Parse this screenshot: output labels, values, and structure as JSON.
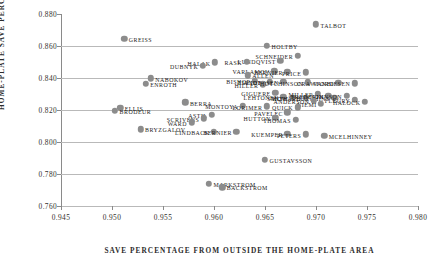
{
  "chart_data": {
    "type": "scatter",
    "title": "",
    "xlabel": "SAVE PERCENTAGE FROM OUTSIDE THE HOME-PLATE AREA",
    "ylabel": "HOME-PLATE SAVE PERCENTAGE",
    "xlim": [
      0.945,
      0.98
    ],
    "ylim": [
      0.76,
      0.88
    ],
    "xticks": [
      "0.945",
      "0.950",
      "0.955",
      "0.960",
      "0.965",
      "0.970",
      "0.975",
      "0.980"
    ],
    "yticks": [
      "0.880",
      "0.860",
      "0.840",
      "0.820",
      "0.800",
      "0.780",
      "0.760"
    ],
    "grid": "horizontal",
    "legend": "none",
    "marker_color": "#8c8c8c",
    "points": [
      {
        "label": "GREISS",
        "x": 0.9512,
        "y": 0.8645,
        "side": "right"
      },
      {
        "label": "HOLTBY",
        "x": 0.9652,
        "y": 0.86,
        "side": "right"
      },
      {
        "label": "TALBOT",
        "x": 0.97,
        "y": 0.8735,
        "side": "right"
      },
      {
        "label": "SCHNEIDER",
        "x": 0.9682,
        "y": 0.8538,
        "side": "left"
      },
      {
        "label": "LUNDQVIST",
        "x": 0.9665,
        "y": 0.8508,
        "side": "left"
      },
      {
        "label": "RASK",
        "x": 0.9632,
        "y": 0.85,
        "side": "left"
      },
      {
        "label": "HALAK",
        "x": 0.9601,
        "y": 0.8497,
        "side": "left"
      },
      {
        "label": "DUBNYK",
        "x": 0.9589,
        "y": 0.8478,
        "side": "left"
      },
      {
        "label": "VARLAMOV",
        "x": 0.9659,
        "y": 0.8442,
        "side": "left"
      },
      {
        "label": "BERNIER",
        "x": 0.9672,
        "y": 0.8438,
        "side": "left"
      },
      {
        "label": "PRICE",
        "x": 0.969,
        "y": 0.8435,
        "side": "left"
      },
      {
        "label": "ALLEN",
        "x": 0.9633,
        "y": 0.8418,
        "side": "right"
      },
      {
        "label": "BISHOP",
        "x": 0.964,
        "y": 0.8382,
        "side": "left"
      },
      {
        "label": "ELLIOTT",
        "x": 0.9655,
        "y": 0.8378,
        "side": "left"
      },
      {
        "label": "ANDERSEN",
        "x": 0.9668,
        "y": 0.8375,
        "side": "left"
      },
      {
        "label": "HILLER",
        "x": 0.9648,
        "y": 0.836,
        "side": "left"
      },
      {
        "label": "HUTCHINSON",
        "x": 0.9692,
        "y": 0.8372,
        "side": "left"
      },
      {
        "label": "CRAWFORD",
        "x": 0.9722,
        "y": 0.837,
        "side": "left"
      },
      {
        "label": "VANBIESEN",
        "x": 0.9738,
        "y": 0.8368,
        "side": "left"
      },
      {
        "label": "NABOKOV",
        "x": 0.9538,
        "y": 0.8398,
        "side": "right"
      },
      {
        "label": "ENROTH",
        "x": 0.9533,
        "y": 0.8365,
        "side": "right"
      },
      {
        "label": "GIGUERE",
        "x": 0.966,
        "y": 0.8308,
        "side": "left"
      },
      {
        "label": "LEHTONEN",
        "x": 0.9668,
        "y": 0.8282,
        "side": "left"
      },
      {
        "label": "SMITH",
        "x": 0.9677,
        "y": 0.8278,
        "side": "left"
      },
      {
        "label": "HOWARD",
        "x": 0.969,
        "y": 0.8275,
        "side": "left"
      },
      {
        "label": "MILLER",
        "x": 0.9702,
        "y": 0.83,
        "side": "left"
      },
      {
        "label": "FREDERIK",
        "x": 0.9712,
        "y": 0.8288,
        "side": "left"
      },
      {
        "label": "HUTCHINS",
        "x": 0.9718,
        "y": 0.8278,
        "side": "left"
      },
      {
        "label": "JOHNSON",
        "x": 0.973,
        "y": 0.8288,
        "side": "left"
      },
      {
        "label": "ANDERSON",
        "x": 0.9698,
        "y": 0.8258,
        "side": "left"
      },
      {
        "label": "NIEMI",
        "x": 0.9705,
        "y": 0.824,
        "side": "left"
      },
      {
        "label": "FLEURY",
        "x": 0.9738,
        "y": 0.8262,
        "side": "left"
      },
      {
        "label": "HALOCK",
        "x": 0.9748,
        "y": 0.8252,
        "side": "left"
      },
      {
        "label": "BERRA",
        "x": 0.9572,
        "y": 0.8248,
        "side": "right"
      },
      {
        "label": "ELLIS",
        "x": 0.9508,
        "y": 0.8212,
        "side": "right"
      },
      {
        "label": "BRODEUR",
        "x": 0.9503,
        "y": 0.8195,
        "side": "right"
      },
      {
        "label": "MONTOYA",
        "x": 0.9628,
        "y": 0.8228,
        "side": "left"
      },
      {
        "label": "LORIMER",
        "x": 0.9652,
        "y": 0.8222,
        "side": "left"
      },
      {
        "label": "QUICK",
        "x": 0.9682,
        "y": 0.8218,
        "side": "left"
      },
      {
        "label": "PAVELEC",
        "x": 0.9672,
        "y": 0.8185,
        "side": "left"
      },
      {
        "label": "ASTIL",
        "x": 0.9598,
        "y": 0.817,
        "side": "left"
      },
      {
        "label": "SCRIVENS",
        "x": 0.959,
        "y": 0.8148,
        "side": "left"
      },
      {
        "label": "HUTTON",
        "x": 0.966,
        "y": 0.815,
        "side": "left"
      },
      {
        "label": "THOMAS",
        "x": 0.968,
        "y": 0.8138,
        "side": "left"
      },
      {
        "label": "WARD",
        "x": 0.9578,
        "y": 0.8122,
        "side": "left"
      },
      {
        "label": "LINDBACK",
        "x": 0.96,
        "y": 0.8065,
        "side": "left"
      },
      {
        "label": "BERNIER2",
        "x": 0.9622,
        "y": 0.8062,
        "side": "left"
      },
      {
        "label": "KUEMPER",
        "x": 0.9672,
        "y": 0.805,
        "side": "left"
      },
      {
        "label": "PETERS",
        "x": 0.969,
        "y": 0.8048,
        "side": "left"
      },
      {
        "label": "MCELHINNEY",
        "x": 0.9708,
        "y": 0.804,
        "side": "right"
      },
      {
        "label": "BRYZGALOV",
        "x": 0.9528,
        "y": 0.808,
        "side": "right"
      },
      {
        "label": "GUSTAVSSON",
        "x": 0.965,
        "y": 0.789,
        "side": "right"
      },
      {
        "label": "MARKSTROM",
        "x": 0.9595,
        "y": 0.774,
        "side": "right"
      },
      {
        "label": "BACKSTROM",
        "x": 0.9608,
        "y": 0.7718,
        "side": "right"
      }
    ]
  }
}
